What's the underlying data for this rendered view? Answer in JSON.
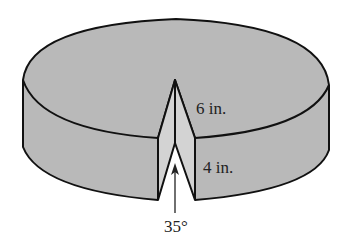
{
  "figure": {
    "labels": {
      "radius": "6 in.",
      "height": "4 in.",
      "angle": "35°"
    },
    "colors": {
      "body_fill": "#b9b9b9",
      "cut_face_fill": "#d3d3d3",
      "outline": "#111111",
      "background": "#ffffff"
    },
    "dimensions": {
      "radius_in": 6,
      "height_in": 4,
      "wedge_angle_deg": 35
    }
  }
}
